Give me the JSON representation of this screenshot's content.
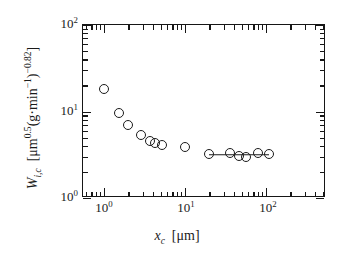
{
  "chart_data": {
    "type": "scatter",
    "title": "",
    "xlabel": "x_c [μm]",
    "ylabel": "W_i,c [μm^0.5 (g·min^-1)^-0.82]",
    "xscale": "log",
    "yscale": "log",
    "xlim": [
      0.55,
      550
    ],
    "ylim": [
      1,
      100
    ],
    "grid": false,
    "legend": null,
    "marker": "open-circle",
    "xtick_labels": [
      "10^0",
      "10^1",
      "10^2"
    ],
    "xtick_values": [
      1,
      10,
      100
    ],
    "ytick_labels": [
      "10^0",
      "10^1",
      "10^2"
    ],
    "ytick_values": [
      1,
      10,
      100
    ],
    "series": [
      {
        "name": "W_i,c measurements",
        "points": [
          {
            "x": 1.0,
            "y": 18.0
          },
          {
            "x": 1.55,
            "y": 9.6
          },
          {
            "x": 2.0,
            "y": 7.0
          },
          {
            "x": 2.9,
            "y": 5.4
          },
          {
            "x": 3.7,
            "y": 4.6
          },
          {
            "x": 4.3,
            "y": 4.3
          },
          {
            "x": 5.2,
            "y": 4.1
          },
          {
            "x": 10.0,
            "y": 3.9
          },
          {
            "x": 20.0,
            "y": 3.2
          },
          {
            "x": 36.0,
            "y": 3.3
          },
          {
            "x": 47.0,
            "y": 3.05
          },
          {
            "x": 57.0,
            "y": 2.95
          },
          {
            "x": 80.0,
            "y": 3.3
          },
          {
            "x": 110.0,
            "y": 3.25
          }
        ]
      }
    ],
    "connector_line": {
      "name": "plateau-connector",
      "x_start": 20.0,
      "x_end": 110.0,
      "y": 3.15
    }
  },
  "axis": {
    "x_title_var": "x",
    "x_title_sub": "c",
    "x_title_unit": "[μm]",
    "y_title_var": "W",
    "y_title_sub": "i,c",
    "y_title_unit_open": "[μm",
    "y_title_unit_exp1": "0.5",
    "y_title_unit_mid": "(g·min",
    "y_title_unit_exp2": "−1",
    "y_title_unit_close": ")",
    "y_title_unit_exp3": "−0.82",
    "y_title_unit_end": "]",
    "tick_base": "10",
    "x_exp_0": "0",
    "x_exp_1": "1",
    "x_exp_2": "2",
    "y_exp_0": "0",
    "y_exp_1": "1",
    "y_exp_2": "2"
  },
  "colors": {
    "axis": "#161616",
    "marker_stroke": "#1b1b1b",
    "background": "#ffffff"
  }
}
